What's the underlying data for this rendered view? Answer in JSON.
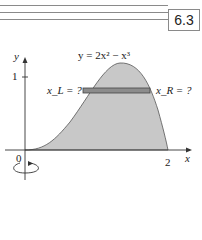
{
  "header": {
    "section_number": "6.3"
  },
  "figure": {
    "y_axis_label": "y",
    "x_axis_label": "x",
    "curve_label": "y = 2x² − x³",
    "left_label": "x_L = ?",
    "right_label": "x_R = ?",
    "tick_y_1": "1",
    "tick_x_0": "0",
    "tick_x_2": "2",
    "colors": {
      "region_fill": "#c8c8c8",
      "strip_fill": "#8c8c8c",
      "axis": "#333333"
    }
  }
}
